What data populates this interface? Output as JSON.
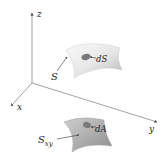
{
  "diagram": {
    "axes": {
      "x_label": "x",
      "y_label": "y",
      "z_label": "z"
    },
    "upper_surface": {
      "label": "S",
      "element_label": "dS"
    },
    "lower_surface": {
      "label_main": "S",
      "label_sub": "xy",
      "element_label": "dA"
    },
    "colors": {
      "axis": "#8a8a8a",
      "upper_surface_light": "#f2f2f2",
      "upper_surface_dark": "#bdbdbd",
      "lower_surface_light": "#c8c8c8",
      "lower_surface_dark": "#8e8e8e",
      "patch": "#7a7a7a",
      "text": "#222222"
    }
  }
}
